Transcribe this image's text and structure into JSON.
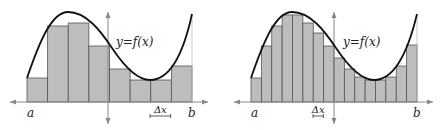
{
  "figure": {
    "colors": {
      "bar_fill": "#bdbdbd",
      "bar_stroke": "#555555",
      "curve": "#111111",
      "axis": "#888888"
    },
    "panels": [
      {
        "id": "left",
        "n_rectangles": 8,
        "curve_label": "y=f(x)",
        "a_label": "a",
        "b_label": "b",
        "delta_label": "Δx",
        "x_start": 27,
        "x_end": 192,
        "axis_y": 102,
        "bar_tops": [
          78,
          26,
          23,
          46,
          69,
          80,
          80,
          66
        ]
      },
      {
        "id": "right",
        "n_rectangles": 16,
        "curve_label": "y=f(x)",
        "a_label": "a",
        "b_label": "b",
        "delta_label": "Δx",
        "x_start": 251,
        "x_end": 417,
        "axis_y": 102,
        "bar_tops": [
          78,
          46,
          26,
          15,
          15,
          23,
          33,
          46,
          58,
          69,
          77,
          80,
          80,
          77,
          66,
          45
        ]
      }
    ]
  }
}
